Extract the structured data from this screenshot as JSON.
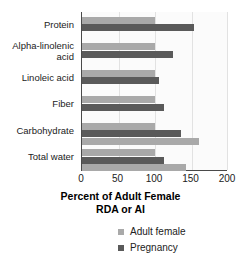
{
  "chart_data": {
    "type": "bar",
    "orientation": "horizontal",
    "title": "",
    "xlabel": "Percent of Adult Female\nRDA or AI",
    "xlabel_line1": "Percent of Adult Female",
    "xlabel_line2": "RDA or AI",
    "ylabel": "",
    "xlim": [
      0,
      200
    ],
    "xticks": [
      0,
      50,
      100,
      150,
      200
    ],
    "xtick_labels": [
      "0",
      "50",
      "100",
      "150",
      "200"
    ],
    "grid": true,
    "grid_axis": "x",
    "legend_position": "bottom",
    "categories": [
      "Protein",
      "Alpha-linolenic acid",
      "Linoleic acid",
      "Fiber",
      "Carbohydrate",
      "Total water"
    ],
    "category_label_lines": [
      [
        "Protein"
      ],
      [
        "Alpha-linolenic",
        "acid"
      ],
      [
        "Linoleic acid"
      ],
      [
        "Fiber"
      ],
      [
        "Carbohydrate"
      ],
      [
        "Total water"
      ]
    ],
    "series": [
      {
        "name": "Adult female",
        "color": "#a9a9a9",
        "values": [
          100,
          100,
          100,
          100,
          160,
          142
        ]
      },
      {
        "name": "Pregnancy",
        "color": "#5a5a5a",
        "values": [
          153,
          124,
          105,
          113,
          135,
          112
        ]
      }
    ],
    "baseline_values": [
      100,
      100,
      100,
      100,
      100,
      100
    ]
  },
  "legend": {
    "items": [
      {
        "label": "Adult female",
        "color": "#a9a9a9"
      },
      {
        "label": "Pregnancy",
        "color": "#5a5a5a"
      }
    ]
  }
}
